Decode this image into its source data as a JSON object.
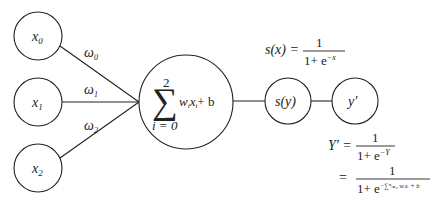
{
  "diagram": {
    "inputs": [
      {
        "var": "x",
        "sub": "0",
        "weight_var": "ω",
        "weight_sub": "0"
      },
      {
        "var": "x",
        "sub": "1",
        "weight_var": "ω",
        "weight_sub": "1"
      },
      {
        "var": "x",
        "sub": "2",
        "weight_var": "ω",
        "weight_sub": "2"
      }
    ],
    "sum_node": {
      "sigma": "∑",
      "upper": "2",
      "lower": "i = 0",
      "w": "w",
      "w_sub": "i",
      "x": "x",
      "x_sub": "i",
      "bias": "+ b"
    },
    "activation_node": {
      "label": "s(y)"
    },
    "output_node": {
      "label": "y′"
    },
    "sigmoid_def": {
      "lhs": "s(x) =",
      "numerator": "1",
      "denominator_base": "1+ e",
      "denominator_exp": "−x"
    },
    "output_eq": {
      "lhs": "Y′ =",
      "numerator": "1",
      "denominator_base": "1+ e",
      "denominator_exp": "−Y",
      "line2_eq": "=",
      "line2_numerator": "1",
      "line2_denominator_base": "1+ e",
      "line2_denominator_exp": "−∑ⁿᵢ₌₀ wᵢxᵢ + b"
    },
    "colors": {
      "stroke": "#222222",
      "background": "#ffffff"
    }
  }
}
